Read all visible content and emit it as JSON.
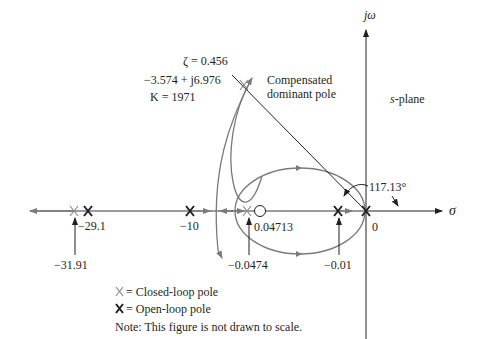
{
  "figure": {
    "type": "root-locus",
    "plane_label": "s-plane",
    "axes": {
      "imag_label": "jω",
      "real_label": "σ"
    },
    "dominant_pole": {
      "zeta_label": "ζ = 0.456",
      "location_label": "−3.574 + j6.976",
      "gain_label": "K = 1971",
      "caption_line1": "Compensated",
      "caption_line2": "dominant pole"
    },
    "angle_label": "117.13°",
    "open_loop_poles": [
      {
        "label": "−29.1",
        "value": -29.1
      },
      {
        "label": "−10",
        "value": -10
      },
      {
        "label": "−0.01",
        "value": -0.01
      },
      {
        "label": "0",
        "value": 0
      }
    ],
    "zeros": [
      {
        "label": "0.04713",
        "value": -0.04713
      }
    ],
    "closed_loop_poles": [
      {
        "label": "−31.91",
        "value": -31.91
      },
      {
        "label": "−0.0474",
        "value": -0.0474
      },
      {
        "label": "−3.574 + j6.976",
        "value": "-3.574+j6.976"
      }
    ],
    "legend": {
      "closed_symbol": "X",
      "closed_text": "= Closed-loop pole",
      "open_symbol": "X",
      "open_text": "= Open-loop pole",
      "note": "Note: This figure is not drawn to scale."
    },
    "colors": {
      "locus": "#7a7a7a",
      "axis": "#231f20",
      "closed_pole": "#8a8a8a"
    }
  }
}
